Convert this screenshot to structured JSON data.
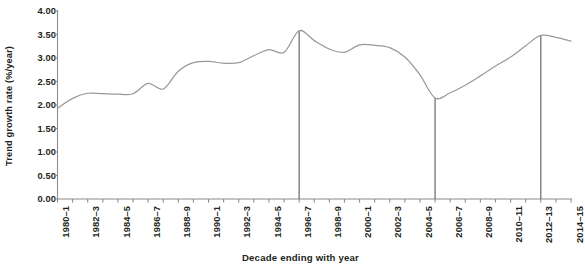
{
  "chart_data": {
    "type": "line",
    "title": "",
    "xlabel": "Decade ending with year",
    "ylabel": "Trend growth rate (%/year)",
    "ylim": [
      0.0,
      4.0
    ],
    "ytick_labels": [
      "0.00",
      "0.50",
      "1.00",
      "1.50",
      "2.00",
      "2.50",
      "3.00",
      "3.50",
      "4.00"
    ],
    "ytick_values": [
      0.0,
      0.5,
      1.0,
      1.5,
      2.0,
      2.5,
      3.0,
      3.5,
      4.0
    ],
    "grid": false,
    "legend": "none",
    "line_color": "#9a9a9a",
    "marker_line_color": "#6d6d6d",
    "axis_color": "#8c8c8c",
    "text_color": "#231f20",
    "categories": [
      "1980–1",
      "1981–2",
      "1982–3",
      "1983–4",
      "1984–5",
      "1985–6",
      "1986–7",
      "1987–8",
      "1988–9",
      "1989–90",
      "1990–1",
      "1991–2",
      "1992–3",
      "1993–4",
      "1994–5",
      "1995–6",
      "1996–7",
      "1997–8",
      "1998–9",
      "1999–2000",
      "2000–1",
      "2001–2",
      "2002–3",
      "2003–4",
      "2004–5",
      "2005–6",
      "2006–7",
      "2007–8",
      "2008–9",
      "2009–10",
      "2010–11",
      "2011–12",
      "2012–13",
      "2013–14",
      "2014–15"
    ],
    "xtick_labels_shown": [
      "1980–1",
      "1982–3",
      "1984–5",
      "1986–7",
      "1988–9",
      "1990–1",
      "1992–3",
      "1994–5",
      "1996–7",
      "1998–9",
      "2000–1",
      "2002–3",
      "2004–5",
      "2006–7",
      "2008–9",
      "2010–11",
      "2012–13",
      "2014–15"
    ],
    "values": [
      1.93,
      2.14,
      2.25,
      2.24,
      2.23,
      2.24,
      2.46,
      2.34,
      2.72,
      2.9,
      2.93,
      2.89,
      2.9,
      3.05,
      3.18,
      3.12,
      3.58,
      3.37,
      3.19,
      3.12,
      3.28,
      3.27,
      3.22,
      3.02,
      2.64,
      2.15,
      2.26,
      2.42,
      2.62,
      2.83,
      3.02,
      3.26,
      3.48,
      3.44,
      3.36
    ],
    "vertical_markers": [
      {
        "category": "1996–7",
        "value": 3.58
      },
      {
        "category": "2005–6",
        "value": 2.15
      },
      {
        "category": "2012–13",
        "value": 3.48
      }
    ]
  }
}
